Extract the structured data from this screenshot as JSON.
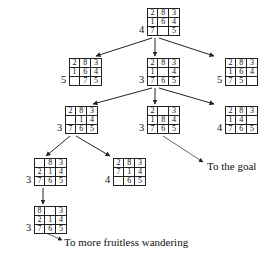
{
  "diagram": {
    "blank_symbol": "",
    "nodes": [
      {
        "id": "root",
        "heuristic": "4",
        "grid": [
          [
            "2",
            "8",
            "3"
          ],
          [
            "1",
            "6",
            "4"
          ],
          [
            "7",
            "",
            "5"
          ]
        ],
        "x": 139,
        "y": 8
      },
      {
        "id": "l2-left",
        "heuristic": "5",
        "grid": [
          [
            "2",
            "8",
            "3"
          ],
          [
            "1",
            "6",
            "4"
          ],
          [
            "",
            "7",
            "5"
          ]
        ],
        "x": 61,
        "y": 58
      },
      {
        "id": "l2-mid",
        "heuristic": "3",
        "grid": [
          [
            "2",
            "8",
            "3"
          ],
          [
            "1",
            "",
            "4"
          ],
          [
            "7",
            "6",
            "5"
          ]
        ],
        "x": 139,
        "y": 58
      },
      {
        "id": "l2-right",
        "heuristic": "5",
        "grid": [
          [
            "2",
            "8",
            "3"
          ],
          [
            "1",
            "6",
            "4"
          ],
          [
            "7",
            "5",
            ""
          ]
        ],
        "x": 217,
        "y": 58
      },
      {
        "id": "l3-left",
        "heuristic": "3",
        "grid": [
          [
            "2",
            "8",
            "3"
          ],
          [
            "",
            "1",
            "4"
          ],
          [
            "7",
            "6",
            "5"
          ]
        ],
        "x": 57,
        "y": 106
      },
      {
        "id": "l3-mid",
        "heuristic": "3",
        "grid": [
          [
            "2",
            "",
            "3"
          ],
          [
            "1",
            "8",
            "4"
          ],
          [
            "7",
            "6",
            "5"
          ]
        ],
        "x": 139,
        "y": 106
      },
      {
        "id": "l3-right",
        "heuristic": "4",
        "grid": [
          [
            "2",
            "8",
            "3"
          ],
          [
            "1",
            "4",
            ""
          ],
          [
            "7",
            "6",
            "5"
          ]
        ],
        "x": 217,
        "y": 106
      },
      {
        "id": "l4-left",
        "heuristic": "3",
        "grid": [
          [
            "",
            "8",
            "3"
          ],
          [
            "2",
            "1",
            "4"
          ],
          [
            "7",
            "6",
            "5"
          ]
        ],
        "x": 26,
        "y": 158
      },
      {
        "id": "l4-right",
        "heuristic": "4",
        "grid": [
          [
            "2",
            "8",
            "3"
          ],
          [
            "7",
            "1",
            "4"
          ],
          [
            "",
            "6",
            "5"
          ]
        ],
        "x": 105,
        "y": 158
      },
      {
        "id": "l5-left",
        "heuristic": "3",
        "grid": [
          [
            "8",
            "",
            "3"
          ],
          [
            "2",
            "1",
            "4"
          ],
          [
            "7",
            "6",
            "5"
          ]
        ],
        "x": 26,
        "y": 206
      }
    ],
    "annotations": [
      {
        "id": "to-the-goal",
        "text": "To the goal",
        "x": 207,
        "y": 160
      },
      {
        "id": "to-more-fruitless-wandering",
        "text": "To more fruitless wandering",
        "x": 64,
        "y": 236
      }
    ],
    "colors": {
      "stroke": "#222222",
      "text": "#111111",
      "background": "#ffffff"
    }
  }
}
